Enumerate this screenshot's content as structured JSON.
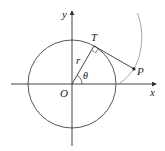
{
  "diagram": {
    "labels": {
      "y_axis": "y",
      "x_axis": "x",
      "origin": "O",
      "tangent_point": "T",
      "curve_point": "P",
      "radius": "r",
      "angle": "θ"
    },
    "geometry": {
      "center": [
        72,
        84
      ],
      "radius_px": 44,
      "theta_deg": 60
    },
    "colors": {
      "stroke": "#333333",
      "curve": "#888888",
      "background": "#ffffff"
    }
  }
}
